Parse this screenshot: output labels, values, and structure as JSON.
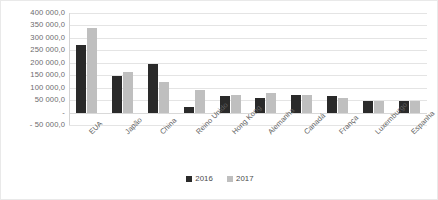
{
  "chart_data": {
    "type": "bar",
    "title": "",
    "subtitle": "",
    "xlabel": "",
    "ylabel": "",
    "grid": true,
    "legend_position": "bottom",
    "ylim": [
      -50000,
      400000
    ],
    "ytick_step": 50000,
    "ytick_labels": [
      "400 000,0",
      "350 000,0",
      "300 000,0",
      "250 000,0",
      "200 000,0",
      "150 000,0",
      "100 000,0",
      "50 000,0",
      "-",
      "- 50 000,0"
    ],
    "ytick_values": [
      400000,
      350000,
      300000,
      250000,
      200000,
      150000,
      100000,
      50000,
      0,
      -50000
    ],
    "categories": [
      "EUA",
      "Japão",
      "China",
      "Reino Unido",
      "Hong Kong",
      "Alemanha",
      "Canadá",
      "França",
      "Luxemburgo",
      "Espanha"
    ],
    "series": [
      {
        "name": "2016",
        "color": "#2a2a2a",
        "values": [
          270000,
          148000,
          196000,
          24000,
          65000,
          57000,
          72000,
          66000,
          48000,
          46000
        ]
      },
      {
        "name": "2017",
        "color": "#bfbfbf",
        "values": [
          338000,
          162000,
          124000,
          92000,
          72000,
          80000,
          70000,
          58000,
          48000,
          48000
        ]
      }
    ]
  },
  "legend": {
    "entries": [
      {
        "label": "2016",
        "color": "#2a2a2a"
      },
      {
        "label": "2017",
        "color": "#bfbfbf"
      }
    ]
  },
  "colors": {
    "series_2016": "#2a2a2a",
    "series_2017": "#bfbfbf",
    "gridline": "#e4e4e4",
    "axis": "#d4d4d4",
    "text": "#5f5f5f",
    "background": "#ffffff"
  }
}
